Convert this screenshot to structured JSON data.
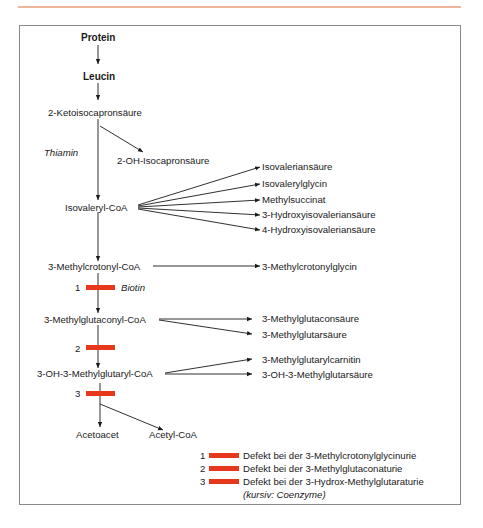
{
  "diagram": {
    "type": "metabolic-pathway",
    "main_chain": [
      {
        "id": "protein",
        "label": "Protein",
        "bold": true
      },
      {
        "id": "leucin",
        "label": "Leucin",
        "bold": true
      },
      {
        "id": "ketoisocapron",
        "label": "2-Ketoisocapronsäure"
      },
      {
        "id": "isovaleryl",
        "label": "Isovaleryl-CoA"
      },
      {
        "id": "methylcrotonyl",
        "label": "3-Methylcrotonyl-CoA"
      },
      {
        "id": "methylglutaconyl",
        "label": "3-Methylglutaconyl-CoA"
      },
      {
        "id": "hmg",
        "label": "3-OH-3-Methylglutaryl-CoA"
      },
      {
        "id": "acetoacet",
        "label": "Acetoacet"
      },
      {
        "id": "acetylcoa",
        "label": "Acetyl-CoA"
      }
    ],
    "coenzymes": {
      "thiamin": "Thiamin",
      "biotin": "Biotin"
    },
    "side_products": {
      "ketoisocapron": [
        "2-OH-Isocapronsäure"
      ],
      "isovaleryl": [
        "Isovaleriansäure",
        "Isovalerylglycin",
        "Methylsuccinat",
        "3-Hydroxyisovaleriansäure",
        "4-Hydroxyisovaleriansäure"
      ],
      "methylcrotonyl": [
        "3-Methylcrotonylglycin"
      ],
      "methylglutaconyl": [
        "3-Methylglutaconsäure",
        "3-Methylglutarsäure"
      ],
      "hmg": [
        "3-Methylglutarylcarnitin",
        "3-OH-3-Methylglutarsäure"
      ]
    },
    "defects": [
      {
        "number": "1",
        "label": "Defekt bei der 3-Methylcrotonylglycinurie"
      },
      {
        "number": "2",
        "label": "Defekt bei der 3-Methylglutaconaturie"
      },
      {
        "number": "3",
        "label": "Defekt bei der 3-Hydrox-Methylglutaraturie"
      }
    ],
    "legend_note": "(kursiv: Coenzyme)",
    "colors": {
      "defect_bar": "#e8381b",
      "top_rule": "#f2b49a",
      "frame": "#8a8a8a",
      "text": "#1a1a1a"
    }
  }
}
